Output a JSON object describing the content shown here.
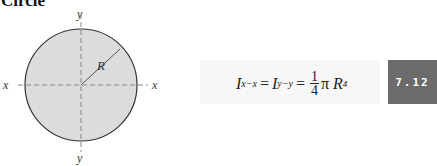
{
  "title": "Circle",
  "figure": {
    "axis_labels": {
      "x_left": "x",
      "x_right": "x",
      "y_top": "y",
      "y_bottom": "y"
    },
    "radius_label": "R",
    "fill_color": "#dcdcdc",
    "stroke_color": "#333333"
  },
  "formula": {
    "lhs1_base": "I",
    "lhs1_sub": "x−x",
    "lhs2_base": "I",
    "lhs2_sub": "y−y",
    "frac_num": "1",
    "frac_den": "4",
    "pi": "π",
    "var": "R",
    "exp": "4",
    "eq": "="
  },
  "badge": {
    "label": "7.12",
    "color": "#6b6b6b"
  }
}
